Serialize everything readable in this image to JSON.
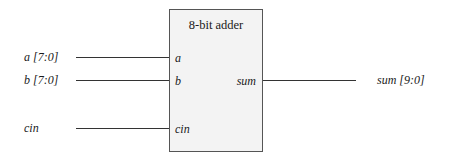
{
  "block": {
    "title": "8-bit adder",
    "ports_in": [
      "a",
      "b",
      "cin"
    ],
    "ports_out": [
      "sum"
    ]
  },
  "signals": {
    "a": "a [7:0]",
    "b": "b [7:0]",
    "cin": "cin",
    "sum": "sum [9:0]"
  }
}
